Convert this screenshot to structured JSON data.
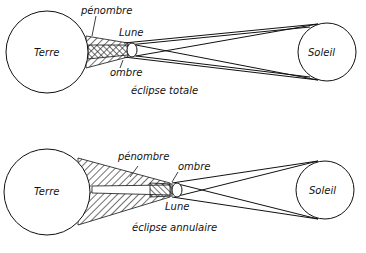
{
  "diagrams": [
    {
      "caption": "éclipse totale",
      "earth": "Terre",
      "sun": "Soleil",
      "moon": "Lune",
      "penumbra": "pénombre",
      "umbra": "ombre"
    },
    {
      "caption": "éclipse annulaire",
      "earth": "Terre",
      "sun": "Soleil",
      "moon": "Lune",
      "penumbra": "pénombre",
      "umbra": "ombre"
    }
  ]
}
